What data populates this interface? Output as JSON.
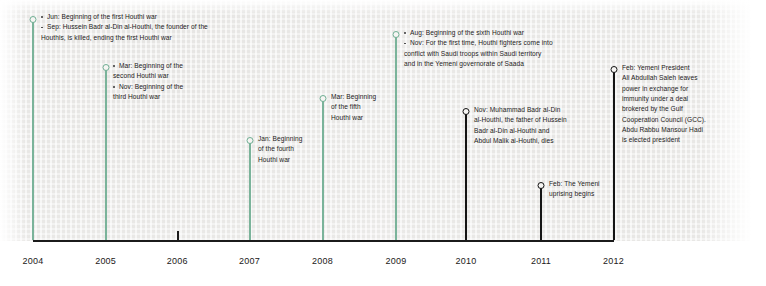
{
  "chart_data": {
    "type": "timeline",
    "title": "",
    "xlabel": "",
    "ylabel": "",
    "grid": false,
    "legend": "none",
    "axis": {
      "ticks": [
        "2004",
        "2005",
        "2006",
        "2007",
        "2008",
        "2009",
        "2010",
        "2011",
        "2012"
      ],
      "range": [
        "2004",
        "2012"
      ]
    },
    "colors": {
      "houthi_war_marker": "#6fae93",
      "other_event_marker": "#121212",
      "axis": "#1b1b1b",
      "paper": "#f1f0ee",
      "text": "#1d1b1b"
    },
    "events": [
      {
        "year": "2004",
        "marker": "green",
        "lines": [
          {
            "text": "Jun: Beginning of the first Houthi war",
            "bullet": true
          },
          {
            "text": "Sep: Hussein Badr al-Din al-Houthi, the founder of the",
            "bullet": true
          },
          {
            "text": "Houthis, is killed, ending the first Houthi war",
            "bullet": false
          }
        ]
      },
      {
        "year": "2005",
        "marker": "green",
        "lines": [
          {
            "text": "Mar: Beginning of the",
            "bullet": true
          },
          {
            "text": "second Houthi war",
            "bullet": false
          },
          {
            "text": "Nov: Beginning of the",
            "bullet": true
          },
          {
            "text": "third Houthi war",
            "bullet": false
          }
        ]
      },
      {
        "year": "2007",
        "marker": "green",
        "lines": [
          {
            "text": "Jan: Beginning",
            "bullet": false
          },
          {
            "text": "of the fourth",
            "bullet": false
          },
          {
            "text": "Houthi war",
            "bullet": false
          }
        ]
      },
      {
        "year": "2008",
        "marker": "green",
        "lines": [
          {
            "text": "Mar: Beginning",
            "bullet": false
          },
          {
            "text": "of the fifth",
            "bullet": false
          },
          {
            "text": "Houthi war",
            "bullet": false
          }
        ]
      },
      {
        "year": "2009",
        "marker": "green",
        "lines": [
          {
            "text": "Aug: Beginning of the sixth Houthi war",
            "bullet": true
          },
          {
            "text": "Nov: For the first time, Houthi fighters come into",
            "bullet": true
          },
          {
            "text": "conflict with Saudi troops within Saudi territory",
            "bullet": false
          },
          {
            "text": "and in the Yemeni governorate of Saada",
            "bullet": false
          }
        ]
      },
      {
        "year": "2010",
        "marker": "black",
        "lines": [
          {
            "text": "Nov: Muhammad Badr al-Din",
            "bullet": false
          },
          {
            "text": "al-Houthi, the father of Hussein",
            "bullet": false
          },
          {
            "text": "Badr al-Din al-Houthi and",
            "bullet": false
          },
          {
            "text": "Abdul Malik ai-Houthi, dies",
            "bullet": false
          }
        ]
      },
      {
        "year": "2011",
        "marker": "black",
        "lines": [
          {
            "text": "Feb: The Yemeni",
            "bullet": false
          },
          {
            "text": "uprising begins",
            "bullet": false
          }
        ]
      },
      {
        "year": "2012",
        "marker": "black",
        "lines": [
          {
            "text": "Feb: Yemeni President",
            "bullet": false
          },
          {
            "text": "Ali Abdullah Saleh leaves",
            "bullet": false
          },
          {
            "text": "power in exchange for",
            "bullet": false
          },
          {
            "text": "immunity under a deal",
            "bullet": false
          },
          {
            "text": "brokered by the Gulf",
            "bullet": false
          },
          {
            "text": "Cooperation Council (GCC).",
            "bullet": false
          },
          {
            "text": "Abdu Rabbu Mansour Hadi",
            "bullet": false
          },
          {
            "text": "is elected president",
            "bullet": false
          }
        ]
      }
    ]
  },
  "layout": {
    "axis_y": 240,
    "axis_x0": 33,
    "axis_x1": 614,
    "label_y": 256,
    "tick_2006_x": 177,
    "positions": {
      "2004": 33,
      "2005": 105.6,
      "2006": 177.2,
      "2007": 249.5,
      "2008": 322.5,
      "2009": 396,
      "2010": 466,
      "2011": 541,
      "2012": 613.5
    },
    "stems": [
      {
        "year": "2004",
        "top": 22,
        "text_x": 41,
        "text_y": 12
      },
      {
        "year": "2005",
        "top": 70,
        "text_x": 113,
        "text_y": 61
      },
      {
        "year": "2007",
        "top": 143,
        "text_x": 258,
        "text_y": 134
      },
      {
        "year": "2008",
        "top": 101,
        "text_x": 331,
        "text_y": 92
      },
      {
        "year": "2009",
        "top": 37,
        "text_x": 404,
        "text_y": 28
      },
      {
        "year": "2010",
        "top": 114,
        "text_x": 474,
        "text_y": 105
      },
      {
        "year": "2011",
        "top": 188,
        "text_x": 549,
        "text_y": 179
      },
      {
        "year": "2012",
        "top": 72,
        "text_x": 622,
        "text_y": 63
      }
    ]
  }
}
